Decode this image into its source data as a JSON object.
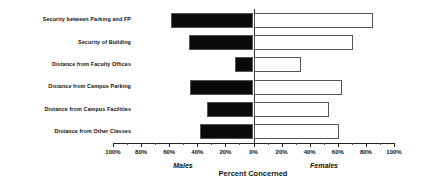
{
  "chart_data": {
    "type": "bar",
    "orientation": "horizontal",
    "style": "diverging-population-pyramid",
    "title": "",
    "xlabel": "Percent Concerned",
    "ylabel": "",
    "categories": [
      "Security between Parking and FP",
      "Security of Building",
      "Distance from Faculty Offices",
      "Distance from Campus Parking",
      "Distance from Campus Facilities",
      "Distance from Other Classes"
    ],
    "series": [
      {
        "name": "Males",
        "side": "left",
        "color": "#0a0a0a",
        "values": [
          59,
          46,
          13,
          45,
          33,
          38
        ]
      },
      {
        "name": "Females",
        "side": "right",
        "color": "#ffffff",
        "values": [
          85,
          71,
          34,
          63,
          54,
          61
        ]
      }
    ],
    "xlim": [
      -100,
      100
    ],
    "xticks": [
      -100,
      -80,
      -60,
      -40,
      -20,
      0,
      20,
      40,
      60,
      80,
      100
    ],
    "xtick_labels": [
      "100%",
      "80%",
      "60%",
      "40%",
      "20%",
      "0%",
      "20%",
      "40%",
      "60%",
      "80%",
      "100%"
    ],
    "minor_xticks": [
      -90,
      -70,
      -50,
      -30,
      -10,
      10,
      30,
      50,
      70,
      90
    ],
    "grid": false,
    "legend": "none",
    "annotations": {
      "left_group": "Males",
      "right_group": "Females",
      "axis_caption": "Percent Concerned"
    }
  }
}
